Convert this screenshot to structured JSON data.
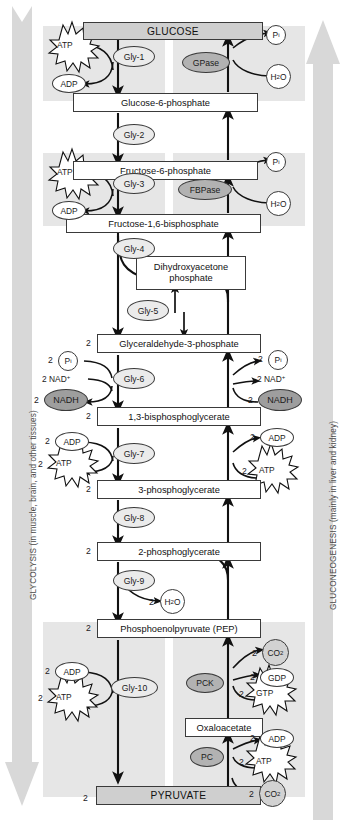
{
  "diagram": {
    "left_banner": "GLYCOLYSIS (in muscle, brain, and other tissues)",
    "right_banner": "GLUCONEOGENESIS (mainly in liver and kidney)",
    "colors": {
      "banner_fill": "#d8d8d8",
      "shade_block": "#e6e6e6",
      "terminal_box": "#cfcfcf",
      "enzyme_light": "#ebebeb",
      "enzyme_dark": "#b2b2b2",
      "cofactor_gray": "#d2d2d2",
      "nadh_fill": "#9e9e9e",
      "stroke": "#3a3a3a"
    }
  },
  "metabolites": [
    {
      "id": "glucose",
      "label": "GLUCOSE",
      "stoich": ""
    },
    {
      "id": "g6p",
      "label": "Glucose-6-phosphate",
      "stoich": ""
    },
    {
      "id": "f6p",
      "label": "Fructose-6-phosphate",
      "stoich": ""
    },
    {
      "id": "f16bp",
      "label": "Fructose-1,6-bisphosphate",
      "stoich": ""
    },
    {
      "id": "dhap_l1",
      "label": "Dihydroxyacetone",
      "stoich": ""
    },
    {
      "id": "dhap_l2",
      "label": "phosphate",
      "stoich": ""
    },
    {
      "id": "g3p",
      "label": "Glyceraldehyde-3-phosphate",
      "stoich": "2"
    },
    {
      "id": "bpg13",
      "label": "1,3-bisphosphoglycerate",
      "stoich": "2"
    },
    {
      "id": "pg3",
      "label": "3-phosphoglycerate",
      "stoich": "2"
    },
    {
      "id": "pg2",
      "label": "2-phosphoglycerate",
      "stoich": "2"
    },
    {
      "id": "pep",
      "label": "Phosphoenolpyruvate (PEP)",
      "stoich": "2"
    },
    {
      "id": "oaa",
      "label": "Oxaloacetate",
      "stoich": ""
    },
    {
      "id": "pyruvate",
      "label": "PYRUVATE",
      "stoich": "2"
    }
  ],
  "enzymes": {
    "glycolytic": [
      {
        "id": "gly1",
        "label": "Gly-1"
      },
      {
        "id": "gly2",
        "label": "Gly-2"
      },
      {
        "id": "gly3",
        "label": "Gly-3"
      },
      {
        "id": "gly4",
        "label": "Gly-4"
      },
      {
        "id": "gly5",
        "label": "Gly-5"
      },
      {
        "id": "gly6",
        "label": "Gly-6"
      },
      {
        "id": "gly7",
        "label": "Gly-7"
      },
      {
        "id": "gly8",
        "label": "Gly-8"
      },
      {
        "id": "gly9",
        "label": "Gly-9"
      },
      {
        "id": "gly10",
        "label": "Gly-10"
      }
    ],
    "gluconeogenic": [
      {
        "id": "gpase",
        "label": "GPase"
      },
      {
        "id": "fbpase",
        "label": "FBPase"
      },
      {
        "id": "pck",
        "label": "PCK"
      },
      {
        "id": "pc",
        "label": "PC"
      }
    ]
  },
  "cofactors": {
    "atp": "ATP",
    "adp": "ADP",
    "gtp": "GTP",
    "gdp": "GDP",
    "pi": "P",
    "pi_sub": "i",
    "water": "H",
    "water_sub": "2",
    "water_tail": "O",
    "nad": "NAD",
    "nad_sup": "+",
    "nadh": "NADH",
    "co2": "CO",
    "co2_sub": "2",
    "two": "2"
  },
  "labels": {
    "glycolysis_side": {
      "step1": {
        "in": "ATP",
        "out": "ADP"
      },
      "step3": {
        "in": "ATP",
        "out": "ADP"
      },
      "step6": {
        "in_pi": "P",
        "in_nad": "NAD",
        "out_nadh": "NADH"
      },
      "step7": {
        "in": "ADP",
        "out": "ATP"
      },
      "step9": {
        "out": "H2O"
      },
      "step10": {
        "in": "ADP",
        "out": "ATP"
      }
    },
    "gluconeogenesis_side": {
      "gpase": {
        "out": "Pi",
        "in": "H2O"
      },
      "fbpase": {
        "out": "Pi",
        "in": "H2O"
      },
      "g3p_rev": {
        "out_pi": "Pi",
        "out_nad": "NAD+",
        "in_nadh": "NADH"
      },
      "bpg_rev": {
        "out": "ADP",
        "in": "ATP"
      },
      "pck": {
        "out_co2": "CO2",
        "out_gdp": "GDP",
        "in_gtp": "GTP"
      },
      "pc": {
        "out_adp": "ADP",
        "in_atp": "ATP",
        "in_co2": "CO2"
      }
    }
  }
}
